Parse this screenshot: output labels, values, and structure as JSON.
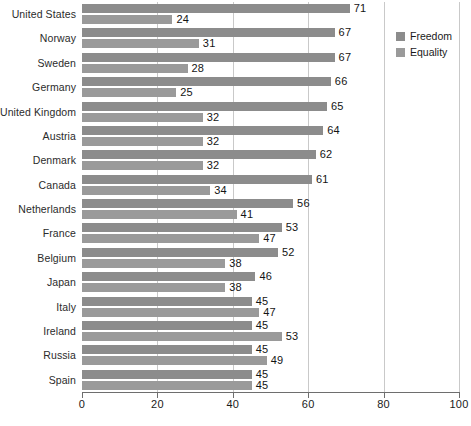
{
  "chart_data": {
    "type": "bar",
    "orientation": "horizontal",
    "title": "",
    "subtitle": "",
    "xlabel": "",
    "ylabel": "",
    "xlim": [
      0,
      100
    ],
    "xticks": [
      0,
      20,
      40,
      60,
      80,
      100
    ],
    "xtick_labels": [
      "0",
      "20",
      "40",
      "60",
      "80",
      "100"
    ],
    "grid": true,
    "grid_axis": "x",
    "legend_position": "right",
    "categories": [
      "United States",
      "Norway",
      "Sweden",
      "Germany",
      "United Kingdom",
      "Austria",
      "Denmark",
      "Canada",
      "Netherlands",
      "France",
      "Belgium",
      "Japan",
      "Italy",
      "Ireland",
      "Russia",
      "Spain"
    ],
    "series": [
      {
        "name": "Freedom",
        "color": "#8c8c8c",
        "values": [
          71,
          67,
          67,
          66,
          65,
          64,
          62,
          61,
          56,
          53,
          52,
          46,
          45,
          45,
          45,
          45
        ]
      },
      {
        "name": "Equality",
        "color": "#9a9a9a",
        "values": [
          24,
          31,
          28,
          25,
          32,
          32,
          32,
          34,
          41,
          47,
          38,
          38,
          47,
          53,
          49,
          45
        ]
      }
    ]
  },
  "legend": {
    "items": [
      {
        "label": "Freedom",
        "color": "#8c8c8c"
      },
      {
        "label": "Equality",
        "color": "#9a9a9a"
      }
    ]
  }
}
